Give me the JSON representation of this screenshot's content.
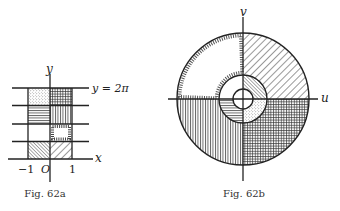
{
  "figures": [
    {
      "id": "62a",
      "caption": "Fig. 62a",
      "axes": {
        "x_label": "x",
        "y_label": "y",
        "origin_label": "O"
      },
      "tick_labels": {
        "left": "−1",
        "right": "1"
      },
      "top_line_label": "y = 2π",
      "cells": [
        {
          "col": "left",
          "row": 4,
          "pattern": "dots"
        },
        {
          "col": "right",
          "row": 4,
          "pattern": "crosshatch"
        },
        {
          "col": "left",
          "row": 3,
          "pattern": "horizontal"
        },
        {
          "col": "right",
          "row": 3,
          "pattern": "vertical"
        },
        {
          "col": "left",
          "row": 2,
          "pattern": "blank"
        },
        {
          "col": "right",
          "row": 2,
          "pattern": "dashed-border"
        },
        {
          "col": "left",
          "row": 1,
          "pattern": "dense-diagonal"
        },
        {
          "col": "right",
          "row": 1,
          "pattern": "diagonal"
        }
      ]
    },
    {
      "id": "62b",
      "caption": "Fig. 62b",
      "axes": {
        "u_label": "u",
        "v_label": "v"
      },
      "regions": [
        {
          "ring": "outer",
          "quadrant": "I",
          "pattern": "diagonal"
        },
        {
          "ring": "outer",
          "quadrant": "II",
          "pattern": "dashed-border"
        },
        {
          "ring": "outer",
          "quadrant": "III",
          "pattern": "vertical"
        },
        {
          "ring": "outer",
          "quadrant": "IV",
          "pattern": "crosshatch"
        },
        {
          "ring": "inner",
          "quadrant": "I",
          "pattern": "dense-diagonal"
        },
        {
          "ring": "inner",
          "quadrant": "II",
          "pattern": "blank"
        },
        {
          "ring": "inner",
          "quadrant": "III",
          "pattern": "horizontal"
        },
        {
          "ring": "inner",
          "quadrant": "IV",
          "pattern": "dots"
        }
      ]
    }
  ]
}
